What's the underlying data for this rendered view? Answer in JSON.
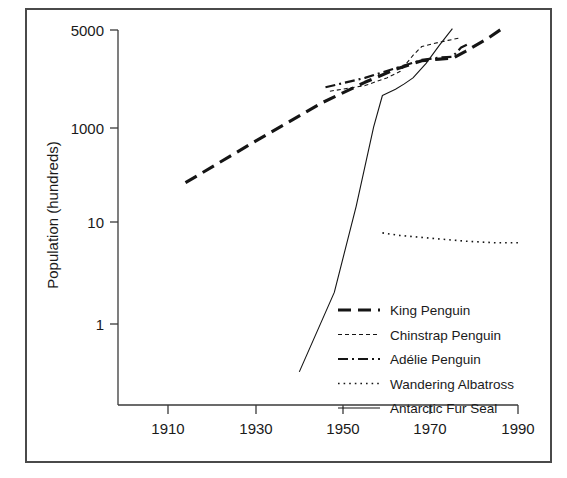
{
  "figure": {
    "background": "#ffffff",
    "frame_color": "#4a4a4a",
    "ink_color": "#151515"
  },
  "axes": {
    "y_title": "Population (hundreds)",
    "x_title": "",
    "y_ticks": [
      "5000",
      "1000",
      "10",
      "1"
    ],
    "x_ticks": [
      "1910",
      "1930",
      "1950",
      "1970",
      "1990"
    ]
  },
  "legend": {
    "position": "bottom-right",
    "entries": [
      {
        "label": "King Penguin",
        "style": "long-dash",
        "dash": "13,7",
        "width": 3.1
      },
      {
        "label": "Chinstrap Penguin",
        "style": "fine-dash",
        "dash": "4,3",
        "width": 1.1
      },
      {
        "label": "Adélie Penguin",
        "style": "dash-dot",
        "dash": "10,4,2,4",
        "width": 2.2
      },
      {
        "label": "Wandering Albatross",
        "style": "dotted",
        "dash": "1.6,4",
        "width": 1.6
      },
      {
        "label": "Antarctic Fur Seal",
        "style": "solid",
        "dash": "none",
        "width": 1.1
      }
    ]
  },
  "chart_data": {
    "type": "line",
    "title": "",
    "xlabel": "",
    "ylabel": "Population (hundreds)",
    "yscale": "log",
    "xlim": [
      1902,
      1994
    ],
    "ylim": [
      0.2,
      6500
    ],
    "grid": false,
    "legend_position": "bottom-right",
    "x_tick_values": [
      1910,
      1930,
      1950,
      1970,
      1990
    ],
    "y_tick_values": [
      1,
      10,
      1000,
      5000
    ],
    "series": [
      {
        "name": "King Penguin",
        "style": "long-dash",
        "points": [
          [
            1914,
            60
          ],
          [
            1930,
            200
          ],
          [
            1945,
            600
          ],
          [
            1955,
            1100
          ],
          [
            1962,
            1600
          ],
          [
            1968,
            2050
          ],
          [
            1972,
            2150
          ],
          [
            1975,
            2200
          ],
          [
            1978,
            2700
          ],
          [
            1983,
            3900
          ],
          [
            1987,
            5500
          ]
        ]
      },
      {
        "name": "Chinstrap Penguin",
        "style": "fine-dash",
        "points": [
          [
            1947,
            850
          ],
          [
            1955,
            1000
          ],
          [
            1960,
            1250
          ],
          [
            1963,
            1500
          ],
          [
            1966,
            2400
          ],
          [
            1968,
            3100
          ],
          [
            1971,
            3400
          ],
          [
            1974,
            3700
          ],
          [
            1977,
            4000
          ]
        ]
      },
      {
        "name": "Adélie Penguin",
        "style": "dash-dot",
        "points": [
          [
            1946,
            950
          ],
          [
            1955,
            1250
          ],
          [
            1962,
            1650
          ],
          [
            1968,
            2100
          ],
          [
            1972,
            2250
          ],
          [
            1975,
            2300
          ],
          [
            1977,
            3000
          ],
          [
            1979,
            3400
          ]
        ]
      },
      {
        "name": "Wandering Albatross",
        "style": "dotted",
        "points": [
          [
            1959,
            14
          ],
          [
            1963,
            13
          ],
          [
            1970,
            12
          ],
          [
            1978,
            11
          ],
          [
            1985,
            10.5
          ],
          [
            1990,
            10.5
          ]
        ]
      },
      {
        "name": "Antarctic Fur Seal",
        "style": "solid",
        "points": [
          [
            1940,
            0.25
          ],
          [
            1948,
            2.5
          ],
          [
            1953,
            30
          ],
          [
            1957,
            300
          ],
          [
            1959,
            750
          ],
          [
            1962,
            900
          ],
          [
            1964,
            1050
          ],
          [
            1966,
            1250
          ],
          [
            1969,
            1900
          ],
          [
            1972,
            3200
          ],
          [
            1975,
            5200
          ]
        ]
      }
    ]
  }
}
